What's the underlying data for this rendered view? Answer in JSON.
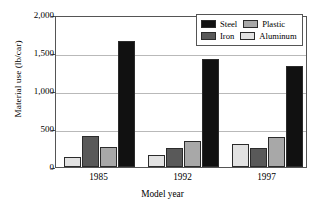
{
  "chart_data": {
    "type": "bar",
    "title": "",
    "xlabel": "Model year",
    "ylabel": "Material use (lb/car)",
    "categories": [
      "1985",
      "1992",
      "1997"
    ],
    "ylim": [
      0,
      2000
    ],
    "yticks": [
      "0",
      "500",
      "1,000",
      "1,500",
      "2,000"
    ],
    "ytick_values": [
      0,
      500,
      1000,
      1500,
      2000
    ],
    "grid": true,
    "legend_position": "top-right",
    "series": [
      {
        "name": "Aluminum",
        "color": "#e2e2e2",
        "values": [
          130,
          155,
          300
        ]
      },
      {
        "name": "Iron",
        "color": "#595959",
        "values": [
          405,
          250,
          255
        ]
      },
      {
        "name": "Plastic",
        "color": "#a8a8a8",
        "values": [
          265,
          340,
          400
        ]
      },
      {
        "name": "Steel",
        "color": "#111111",
        "values": [
          1660,
          1415,
          1330
        ]
      }
    ]
  },
  "legend": {
    "rows": [
      [
        {
          "label": "Steel",
          "color": "#111111",
          "icon": "legend-swatch-steel"
        },
        {
          "label": "Plastic",
          "color": "#a8a8a8",
          "icon": "legend-swatch-plastic"
        }
      ],
      [
        {
          "label": "Iron",
          "color": "#595959",
          "icon": "legend-swatch-iron"
        },
        {
          "label": "Aluminum",
          "color": "#e2e2e2",
          "icon": "legend-swatch-aluminum"
        }
      ]
    ]
  },
  "axes": {
    "y_title": "Material use (lb/car)",
    "x_title": "Model year"
  }
}
